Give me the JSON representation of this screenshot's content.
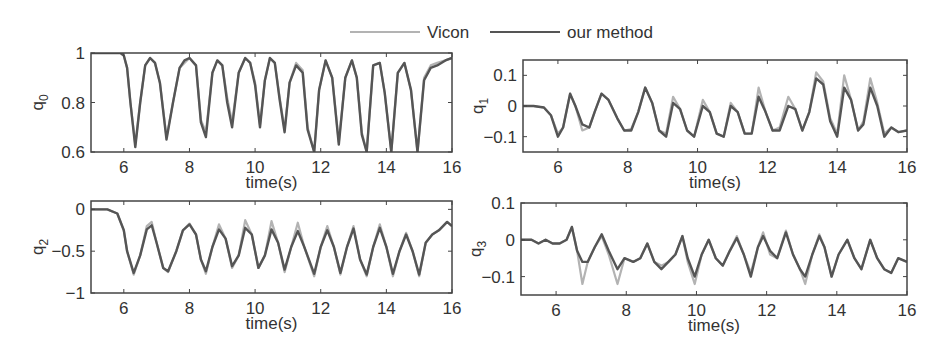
{
  "legend": {
    "items": [
      {
        "label": "Vicon",
        "color": "#b3b3b3"
      },
      {
        "label": "our method",
        "color": "#555555"
      }
    ]
  },
  "chart_data": [
    {
      "type": "line",
      "id": "q0",
      "ylabel": "q",
      "ylabel_sub": "0",
      "xlabel": "time(s)",
      "xlim": [
        5,
        16
      ],
      "ylim": [
        0.6,
        1.0
      ],
      "xticks": [
        6,
        8,
        10,
        12,
        14,
        16
      ],
      "yticks": [
        0.6,
        0.8,
        1
      ],
      "ytick_labels": [
        "0.6",
        "0.8",
        "1"
      ],
      "box": {
        "left": 91,
        "top": 53,
        "right": 452,
        "bottom": 152
      },
      "series": [
        {
          "name": "Vicon",
          "x": [
            5,
            5.9,
            6.0,
            6.1,
            6.2,
            6.35,
            6.5,
            6.65,
            6.8,
            6.95,
            7.1,
            7.3,
            7.5,
            7.7,
            7.85,
            8.0,
            8.2,
            8.35,
            8.5,
            8.7,
            8.85,
            9.0,
            9.15,
            9.3,
            9.5,
            9.7,
            9.85,
            10.0,
            10.15,
            10.3,
            10.45,
            10.6,
            10.75,
            10.9,
            11.05,
            11.25,
            11.45,
            11.6,
            11.8,
            11.95,
            12.15,
            12.35,
            12.55,
            12.75,
            12.95,
            13.1,
            13.25,
            13.4,
            13.6,
            13.8,
            13.95,
            14.15,
            14.35,
            14.55,
            14.75,
            14.95,
            15.15,
            15.35,
            15.55,
            15.8,
            16
          ],
          "y": [
            1,
            1,
            0.99,
            0.94,
            0.8,
            0.63,
            0.8,
            0.95,
            0.98,
            0.96,
            0.88,
            0.66,
            0.8,
            0.94,
            0.96,
            0.98,
            0.95,
            0.73,
            0.68,
            0.92,
            0.97,
            0.95,
            0.82,
            0.72,
            0.92,
            0.98,
            0.96,
            0.88,
            0.71,
            0.89,
            0.98,
            0.96,
            0.82,
            0.69,
            0.88,
            0.96,
            0.93,
            0.7,
            0.6,
            0.85,
            0.97,
            0.9,
            0.64,
            0.9,
            0.97,
            0.9,
            0.68,
            0.6,
            0.95,
            0.96,
            0.84,
            0.6,
            0.92,
            0.96,
            0.85,
            0.6,
            0.9,
            0.95,
            0.96,
            0.97,
            0.98
          ]
        },
        {
          "name": "our method",
          "x": [
            5,
            5.9,
            6.0,
            6.1,
            6.2,
            6.35,
            6.5,
            6.65,
            6.8,
            6.95,
            7.1,
            7.3,
            7.5,
            7.7,
            7.85,
            8.0,
            8.2,
            8.35,
            8.5,
            8.7,
            8.85,
            9.0,
            9.15,
            9.3,
            9.5,
            9.7,
            9.85,
            10.0,
            10.15,
            10.3,
            10.45,
            10.6,
            10.75,
            10.9,
            11.05,
            11.25,
            11.45,
            11.6,
            11.8,
            11.95,
            12.15,
            12.35,
            12.55,
            12.75,
            12.95,
            13.1,
            13.25,
            13.4,
            13.6,
            13.8,
            13.95,
            14.15,
            14.35,
            14.55,
            14.75,
            14.95,
            15.15,
            15.35,
            15.55,
            15.8,
            16
          ],
          "y": [
            1,
            1,
            0.99,
            0.94,
            0.8,
            0.62,
            0.8,
            0.95,
            0.98,
            0.96,
            0.88,
            0.65,
            0.8,
            0.94,
            0.97,
            0.98,
            0.95,
            0.72,
            0.66,
            0.92,
            0.97,
            0.95,
            0.8,
            0.7,
            0.92,
            0.98,
            0.96,
            0.87,
            0.7,
            0.89,
            0.98,
            0.96,
            0.81,
            0.68,
            0.88,
            0.95,
            0.92,
            0.69,
            0.6,
            0.85,
            0.97,
            0.9,
            0.63,
            0.9,
            0.97,
            0.9,
            0.67,
            0.6,
            0.95,
            0.96,
            0.84,
            0.6,
            0.92,
            0.96,
            0.85,
            0.6,
            0.89,
            0.94,
            0.95,
            0.97,
            0.98
          ]
        }
      ]
    },
    {
      "type": "line",
      "id": "q1",
      "ylabel": "q",
      "ylabel_sub": "1",
      "xlabel": "time(s)",
      "xlim": [
        5,
        16
      ],
      "ylim": [
        -0.15,
        0.15
      ],
      "xticks": [
        6,
        8,
        10,
        12,
        14,
        16
      ],
      "yticks": [
        -0.1,
        0,
        0.1
      ],
      "ytick_labels": [
        "−0.1",
        "0",
        "0.1"
      ],
      "box": {
        "left": 523,
        "top": 60,
        "right": 907,
        "bottom": 152
      },
      "series": [
        {
          "name": "Vicon",
          "x": [
            5,
            5.3,
            5.6,
            5.8,
            6.0,
            6.15,
            6.35,
            6.5,
            6.7,
            6.9,
            7.05,
            7.25,
            7.45,
            7.7,
            7.9,
            8.1,
            8.3,
            8.5,
            8.7,
            8.9,
            9.1,
            9.3,
            9.5,
            9.7,
            9.9,
            10.15,
            10.35,
            10.55,
            10.75,
            10.95,
            11.15,
            11.35,
            11.55,
            11.75,
            11.95,
            12.15,
            12.35,
            12.6,
            12.8,
            13.0,
            13.2,
            13.4,
            13.6,
            13.8,
            14.0,
            14.2,
            14.4,
            14.6,
            14.75,
            14.95,
            15.15,
            15.35,
            15.55,
            15.75,
            16
          ],
          "y": [
            0,
            0,
            -0.005,
            -0.03,
            -0.09,
            -0.07,
            0.04,
            0,
            -0.08,
            -0.07,
            -0.02,
            0.04,
            0.02,
            -0.04,
            -0.08,
            -0.075,
            -0.02,
            0.06,
            0.01,
            -0.08,
            -0.09,
            0.03,
            -0.01,
            -0.08,
            -0.1,
            0.02,
            -0.02,
            -0.09,
            -0.1,
            0.01,
            -0.02,
            -0.09,
            -0.09,
            0.06,
            -0.02,
            -0.08,
            -0.07,
            0.03,
            -0.01,
            -0.08,
            -0.02,
            0.11,
            0.08,
            -0.04,
            -0.09,
            0.1,
            0.02,
            -0.08,
            -0.05,
            0.09,
            0.01,
            -0.09,
            -0.07,
            -0.085,
            -0.08
          ]
        },
        {
          "name": "our method",
          "x": [
            5,
            5.3,
            5.6,
            5.8,
            6.0,
            6.15,
            6.35,
            6.5,
            6.7,
            6.9,
            7.05,
            7.25,
            7.45,
            7.7,
            7.9,
            8.1,
            8.3,
            8.5,
            8.7,
            8.9,
            9.1,
            9.3,
            9.5,
            9.7,
            9.9,
            10.15,
            10.35,
            10.55,
            10.75,
            10.95,
            11.15,
            11.35,
            11.55,
            11.75,
            11.95,
            12.15,
            12.35,
            12.6,
            12.8,
            13.0,
            13.2,
            13.4,
            13.6,
            13.8,
            14.0,
            14.2,
            14.4,
            14.6,
            14.75,
            14.95,
            15.15,
            15.35,
            15.55,
            15.75,
            16
          ],
          "y": [
            0,
            0,
            -0.005,
            -0.03,
            -0.1,
            -0.07,
            0.04,
            0,
            -0.06,
            -0.07,
            -0.02,
            0.04,
            0.02,
            -0.04,
            -0.08,
            -0.08,
            -0.02,
            0.06,
            0.01,
            -0.08,
            -0.1,
            0.01,
            -0.01,
            -0.08,
            -0.1,
            0,
            -0.02,
            -0.09,
            -0.1,
            0,
            -0.02,
            -0.09,
            -0.09,
            0.03,
            -0.02,
            -0.08,
            -0.08,
            0,
            -0.01,
            -0.08,
            -0.02,
            0.09,
            0.07,
            -0.05,
            -0.1,
            0.06,
            0.02,
            -0.08,
            -0.06,
            0.06,
            0,
            -0.1,
            -0.07,
            -0.085,
            -0.08
          ]
        }
      ]
    },
    {
      "type": "line",
      "id": "q2",
      "ylabel": "q",
      "ylabel_sub": "2",
      "xlabel": "time(s)",
      "xlim": [
        5,
        16
      ],
      "ylim": [
        -1,
        0.1
      ],
      "xticks": [
        6,
        8,
        10,
        12,
        14,
        16
      ],
      "yticks": [
        -1,
        -0.5,
        0
      ],
      "ytick_labels": [
        "−1",
        "−0.5",
        "0"
      ],
      "box": {
        "left": 91,
        "top": 201,
        "right": 452,
        "bottom": 293
      },
      "series": [
        {
          "name": "Vicon",
          "x": [
            5,
            5.5,
            5.8,
            6.0,
            6.1,
            6.3,
            6.5,
            6.7,
            6.85,
            7.0,
            7.2,
            7.35,
            7.6,
            7.8,
            8.0,
            8.2,
            8.35,
            8.5,
            8.7,
            8.9,
            9.1,
            9.3,
            9.5,
            9.7,
            9.9,
            10.1,
            10.3,
            10.5,
            10.7,
            10.9,
            11.1,
            11.3,
            11.5,
            11.8,
            12.0,
            12.2,
            12.4,
            12.6,
            12.8,
            13.0,
            13.2,
            13.4,
            13.6,
            13.8,
            14.0,
            14.2,
            14.4,
            14.6,
            14.8,
            15.0,
            15.2,
            15.4,
            15.6,
            15.85,
            16
          ],
          "y": [
            0,
            0,
            -0.05,
            -0.25,
            -0.5,
            -0.78,
            -0.55,
            -0.2,
            -0.15,
            -0.4,
            -0.7,
            -0.75,
            -0.5,
            -0.25,
            -0.17,
            -0.3,
            -0.6,
            -0.77,
            -0.45,
            -0.18,
            -0.35,
            -0.7,
            -0.55,
            -0.13,
            -0.3,
            -0.7,
            -0.55,
            -0.14,
            -0.4,
            -0.75,
            -0.45,
            -0.16,
            -0.45,
            -0.8,
            -0.45,
            -0.2,
            -0.45,
            -0.78,
            -0.45,
            -0.2,
            -0.6,
            -0.8,
            -0.45,
            -0.18,
            -0.45,
            -0.8,
            -0.5,
            -0.28,
            -0.5,
            -0.8,
            -0.4,
            -0.3,
            -0.25,
            -0.15,
            -0.2
          ]
        },
        {
          "name": "our method",
          "x": [
            5,
            5.5,
            5.8,
            6.0,
            6.1,
            6.3,
            6.5,
            6.7,
            6.85,
            7.0,
            7.2,
            7.35,
            7.6,
            7.8,
            8.0,
            8.2,
            8.35,
            8.5,
            8.7,
            8.9,
            9.1,
            9.3,
            9.5,
            9.7,
            9.9,
            10.1,
            10.3,
            10.5,
            10.7,
            10.9,
            11.1,
            11.3,
            11.5,
            11.8,
            12.0,
            12.2,
            12.4,
            12.6,
            12.8,
            13.0,
            13.2,
            13.4,
            13.6,
            13.8,
            14.0,
            14.2,
            14.4,
            14.6,
            14.8,
            15.0,
            15.2,
            15.4,
            15.6,
            15.85,
            16
          ],
          "y": [
            0,
            0,
            -0.05,
            -0.25,
            -0.5,
            -0.76,
            -0.55,
            -0.24,
            -0.19,
            -0.4,
            -0.7,
            -0.74,
            -0.5,
            -0.25,
            -0.18,
            -0.3,
            -0.6,
            -0.74,
            -0.45,
            -0.24,
            -0.35,
            -0.68,
            -0.55,
            -0.22,
            -0.3,
            -0.7,
            -0.55,
            -0.24,
            -0.4,
            -0.72,
            -0.45,
            -0.26,
            -0.45,
            -0.77,
            -0.45,
            -0.25,
            -0.45,
            -0.76,
            -0.45,
            -0.23,
            -0.6,
            -0.78,
            -0.45,
            -0.22,
            -0.45,
            -0.77,
            -0.5,
            -0.3,
            -0.5,
            -0.78,
            -0.4,
            -0.3,
            -0.25,
            -0.15,
            -0.2
          ]
        }
      ]
    },
    {
      "type": "line",
      "id": "q3",
      "ylabel": "q",
      "ylabel_sub": "3",
      "xlabel": "time(s)",
      "xlim": [
        5,
        16
      ],
      "ylim": [
        -0.15,
        0.1
      ],
      "xticks": [
        6,
        8,
        10,
        12,
        14,
        16
      ],
      "yticks": [
        -0.1,
        0,
        0.1
      ],
      "ytick_labels": [
        "−0.1",
        "0",
        "0.1"
      ],
      "box": {
        "left": 521,
        "top": 203,
        "right": 907,
        "bottom": 295
      },
      "series": [
        {
          "name": "Vicon",
          "x": [
            5,
            5.3,
            5.5,
            5.7,
            5.9,
            6.1,
            6.3,
            6.45,
            6.6,
            6.75,
            6.9,
            7.1,
            7.3,
            7.5,
            7.75,
            7.95,
            8.2,
            8.4,
            8.6,
            8.8,
            9.0,
            9.2,
            9.4,
            9.6,
            9.75,
            9.95,
            10.15,
            10.35,
            10.55,
            10.75,
            10.95,
            11.15,
            11.35,
            11.55,
            11.75,
            11.9,
            12.1,
            12.3,
            12.55,
            12.75,
            12.95,
            13.1,
            13.3,
            13.5,
            13.65,
            13.85,
            14.05,
            14.3,
            14.5,
            14.7,
            14.95,
            15.15,
            15.35,
            15.55,
            15.75,
            16
          ],
          "y": [
            0,
            0,
            -0.01,
            0,
            -0.01,
            -0.01,
            0,
            0.035,
            -0.03,
            -0.12,
            -0.06,
            -0.02,
            0.01,
            -0.04,
            -0.12,
            -0.05,
            -0.06,
            -0.05,
            -0.01,
            -0.06,
            -0.07,
            -0.06,
            -0.04,
            0.01,
            -0.06,
            -0.12,
            -0.04,
            0,
            -0.05,
            -0.07,
            -0.03,
            0.01,
            -0.04,
            -0.09,
            -0.02,
            0.02,
            -0.04,
            -0.05,
            0.025,
            -0.04,
            -0.08,
            -0.12,
            -0.04,
            0.015,
            -0.02,
            -0.1,
            -0.04,
            0,
            -0.05,
            -0.08,
            0,
            -0.05,
            -0.08,
            -0.09,
            -0.05,
            -0.06
          ]
        },
        {
          "name": "our method",
          "x": [
            5,
            5.3,
            5.5,
            5.7,
            5.9,
            6.1,
            6.3,
            6.45,
            6.6,
            6.75,
            6.9,
            7.1,
            7.3,
            7.5,
            7.75,
            7.95,
            8.2,
            8.4,
            8.6,
            8.8,
            9.0,
            9.2,
            9.4,
            9.6,
            9.75,
            9.95,
            10.15,
            10.35,
            10.55,
            10.75,
            10.95,
            11.15,
            11.35,
            11.55,
            11.75,
            11.9,
            12.1,
            12.3,
            12.55,
            12.75,
            12.95,
            13.1,
            13.3,
            13.5,
            13.65,
            13.85,
            14.05,
            14.3,
            14.5,
            14.7,
            14.95,
            15.15,
            15.35,
            15.55,
            15.75,
            16
          ],
          "y": [
            0,
            0,
            -0.01,
            0,
            -0.01,
            -0.01,
            0,
            0.035,
            -0.03,
            -0.06,
            -0.06,
            -0.02,
            0.015,
            -0.03,
            -0.08,
            -0.05,
            -0.06,
            -0.05,
            -0.01,
            -0.06,
            -0.08,
            -0.06,
            -0.04,
            0.01,
            -0.05,
            -0.1,
            -0.04,
            0,
            -0.05,
            -0.07,
            -0.03,
            0.005,
            -0.04,
            -0.1,
            -0.02,
            0.01,
            -0.03,
            -0.05,
            0.02,
            -0.04,
            -0.08,
            -0.1,
            -0.04,
            0.01,
            -0.02,
            -0.1,
            -0.04,
            0,
            -0.05,
            -0.08,
            0,
            -0.05,
            -0.08,
            -0.09,
            -0.05,
            -0.06
          ]
        }
      ]
    }
  ]
}
